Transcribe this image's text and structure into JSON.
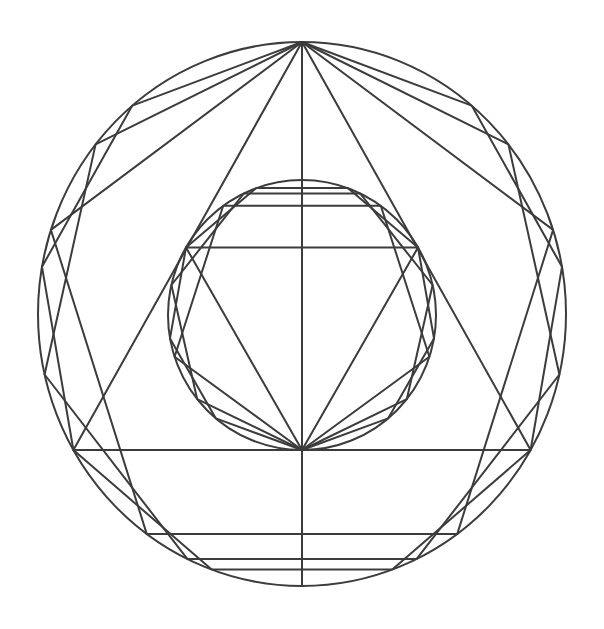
{
  "canvas": {
    "width": 604,
    "height": 629,
    "background": "#ffffff"
  },
  "style": {
    "stroke": "#3c3c3c",
    "stroke_width": 2
  },
  "diagram": {
    "outer_circle": {
      "cx": 302,
      "cy": 314,
      "rx": 264,
      "ry": 272
    },
    "inner_circle": {
      "cx": 302,
      "cy": 315,
      "rx": 134,
      "ry": 135
    },
    "outer_polygons": {
      "anchor": "top",
      "sides": [
        3,
        5,
        7,
        9
      ]
    },
    "inner_polygons": {
      "anchor": "bottom",
      "sides": [
        3,
        5,
        7,
        9
      ]
    },
    "vertical_axis": {
      "x": 302,
      "y1": 43,
      "y2": 586
    }
  }
}
